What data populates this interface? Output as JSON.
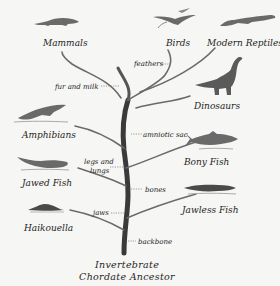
{
  "root": {
    "line1": "Invertebrate",
    "line2": "Chordate Ancestor"
  },
  "groups": [
    {
      "name": "Mammals",
      "icon": "mammal-icon"
    },
    {
      "name": "Birds",
      "icon": "bird-icon"
    },
    {
      "name": "Modern Reptiles",
      "icon": "reptile-icon"
    },
    {
      "name": "Dinosaurs",
      "icon": "dinosaur-icon"
    },
    {
      "name": "Amphibians",
      "icon": "amphibian-icon"
    },
    {
      "name": "Bony Fish",
      "icon": "bony-fish-icon"
    },
    {
      "name": "Jawed Fish",
      "icon": "jawed-fish-icon"
    },
    {
      "name": "Jawless Fish",
      "icon": "jawless-fish-icon"
    },
    {
      "name": "Haikouella",
      "icon": "haikouella-icon"
    }
  ],
  "traits": [
    {
      "label": "feathers"
    },
    {
      "label": "fur and milk"
    },
    {
      "label": "amniotic sac"
    },
    {
      "label": "legs and",
      "label2": "lungs"
    },
    {
      "label": "bones"
    },
    {
      "label": "jaws"
    },
    {
      "label": "backbone"
    }
  ],
  "colors": {
    "branch": "#4a4a4a",
    "background": "#f6f6f4",
    "text": "#1e1e1e",
    "animal": "#6a6a6a"
  }
}
